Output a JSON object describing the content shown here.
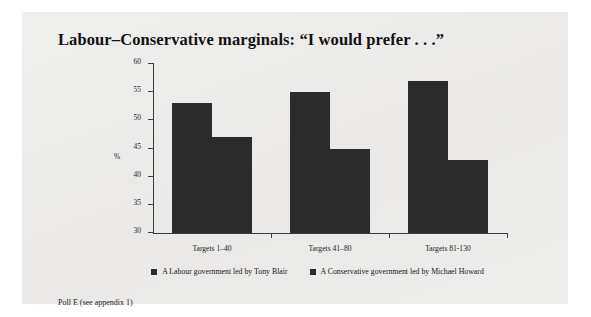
{
  "title": "Labour–Conservative marginals: “I would prefer . . .”",
  "footnote": "Poll E (see appendix 1)",
  "colors": {
    "bar": "#2b2b2b",
    "panel_background": "#ececeb",
    "page_background": "#ffffff",
    "axis": "#3d3d3d",
    "text": "#141414"
  },
  "chart_data": {
    "type": "bar",
    "title": "Labour–Conservative marginals: “I would prefer . . .”",
    "xlabel": "",
    "ylabel": "%",
    "ylim": [
      30,
      60
    ],
    "yticks": [
      30,
      35,
      40,
      45,
      50,
      55,
      60
    ],
    "ytick_labels": [
      "30",
      "35",
      "40",
      "45",
      "50",
      "55",
      "60"
    ],
    "grid": false,
    "legend_position": "bottom",
    "categories": [
      "Targets 1–40",
      "Targets 41–80",
      "Targets 81-130"
    ],
    "series": [
      {
        "name": "A Labour government led by Tony Blair",
        "values": [
          53,
          55,
          57
        ]
      },
      {
        "name": "A Conservative government led by Michael Howard",
        "values": [
          47,
          45,
          43
        ]
      }
    ],
    "annotations": [
      "Poll E (see appendix 1)"
    ]
  }
}
